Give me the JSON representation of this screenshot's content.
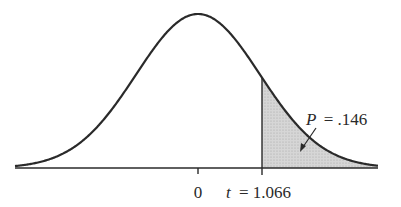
{
  "chart_data": {
    "type": "area",
    "title": "",
    "distribution": "t (bell-shaped density curve)",
    "x_tick_labels": [
      "0",
      "t = 1.066"
    ],
    "x_ticks": [
      0,
      1.066
    ],
    "shaded_region": {
      "from": 1.066,
      "to": "infinity",
      "side": "right tail",
      "label": "P = .146",
      "probability": 0.146
    },
    "xlabel": "",
    "ylabel": "",
    "grid": false,
    "legend": "none",
    "colors": {
      "curve": "#2a2a2a",
      "shade": "#cfcfcf",
      "axis": "#2a2a2a"
    }
  },
  "labels": {
    "zero": "0",
    "t_prefix": "t",
    "t_value": "= 1.066",
    "p_prefix": "P",
    "p_value": "= .146"
  }
}
